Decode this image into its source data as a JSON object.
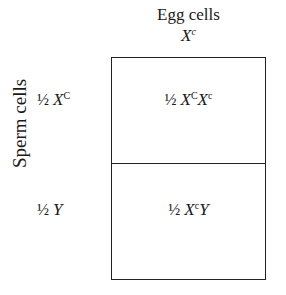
{
  "title": "Egg cells",
  "egg": {
    "half": "",
    "allele": "X",
    "sup": "c"
  },
  "side_label": "Sperm cells",
  "sperm": [
    {
      "half": "½",
      "allele": "X",
      "sup": "C"
    },
    {
      "half": "½",
      "allele": "Y",
      "sup": ""
    }
  ],
  "cells": [
    {
      "half": "½",
      "a": "X",
      "a_sup": "C",
      "b": "X",
      "b_sup": "c"
    },
    {
      "half": "½",
      "a": "X",
      "a_sup": "c",
      "b": "Y",
      "b_sup": ""
    }
  ]
}
